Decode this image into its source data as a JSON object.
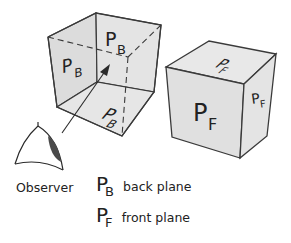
{
  "diagram": {
    "observer_label": "Observer",
    "back_cube": {
      "name": "back plane cube (transparent)",
      "labels": [
        {
          "main": "P",
          "sub": "B",
          "face": "left-back"
        },
        {
          "main": "P",
          "sub": "B",
          "face": "right-back"
        },
        {
          "main": "P",
          "sub": "B",
          "face": "bottom"
        }
      ]
    },
    "front_cube": {
      "name": "front plane cube (solid)",
      "labels": [
        {
          "main": "P",
          "sub": "F",
          "face": "top"
        },
        {
          "main": "P",
          "sub": "F",
          "face": "front"
        },
        {
          "main": "P",
          "sub": "F",
          "face": "side"
        }
      ]
    },
    "legend": [
      {
        "main": "P",
        "sub": "B",
        "text": "back plane"
      },
      {
        "main": "P",
        "sub": "F",
        "text": "front plane"
      }
    ],
    "colors": {
      "face_fill": "#e2e2e2",
      "face_fill_light": "#ebebeb",
      "edge": "#3a3a3a",
      "pupil": "#4a4a4a"
    }
  }
}
